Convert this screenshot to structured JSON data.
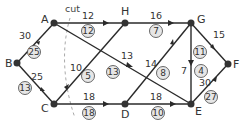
{
  "diagram": {
    "type": "flow-network",
    "cut_label": "cut",
    "nodes": [
      {
        "id": "A",
        "label": "A",
        "x": 54,
        "y": 23
      },
      {
        "id": "B",
        "label": "B",
        "x": 17,
        "y": 63
      },
      {
        "id": "C",
        "label": "C",
        "x": 54,
        "y": 104
      },
      {
        "id": "H",
        "label": "H",
        "x": 125,
        "y": 23
      },
      {
        "id": "G",
        "label": "G",
        "x": 191,
        "y": 23
      },
      {
        "id": "D",
        "label": "D",
        "x": 125,
        "y": 104
      },
      {
        "id": "E",
        "label": "E",
        "x": 191,
        "y": 104
      },
      {
        "id": "F",
        "label": "F",
        "x": 228,
        "y": 64
      }
    ],
    "edges": [
      {
        "from": "B",
        "to": "A",
        "capacity": "30",
        "flow": "25"
      },
      {
        "from": "B",
        "to": "C",
        "capacity": "25",
        "flow": "13"
      },
      {
        "from": "A",
        "to": "H",
        "capacity": "12",
        "flow": "12"
      },
      {
        "from": "A",
        "to": "E",
        "capacity": "13",
        "flow": "13"
      },
      {
        "from": "H",
        "to": "C",
        "capacity": "10",
        "flow": "5"
      },
      {
        "from": "C",
        "to": "D",
        "capacity": "18",
        "flow": "18"
      },
      {
        "from": "H",
        "to": "G",
        "capacity": "16",
        "flow": "7"
      },
      {
        "from": "D",
        "to": "G",
        "capacity": "14",
        "flow": "8"
      },
      {
        "from": "G",
        "to": "E",
        "capacity": "7",
        "flow": "4"
      },
      {
        "from": "G",
        "to": "F",
        "capacity": "15",
        "flow": "11"
      },
      {
        "from": "D",
        "to": "E",
        "capacity": "18",
        "flow": "10"
      },
      {
        "from": "E",
        "to": "F",
        "capacity": "30",
        "flow": "27"
      }
    ]
  }
}
